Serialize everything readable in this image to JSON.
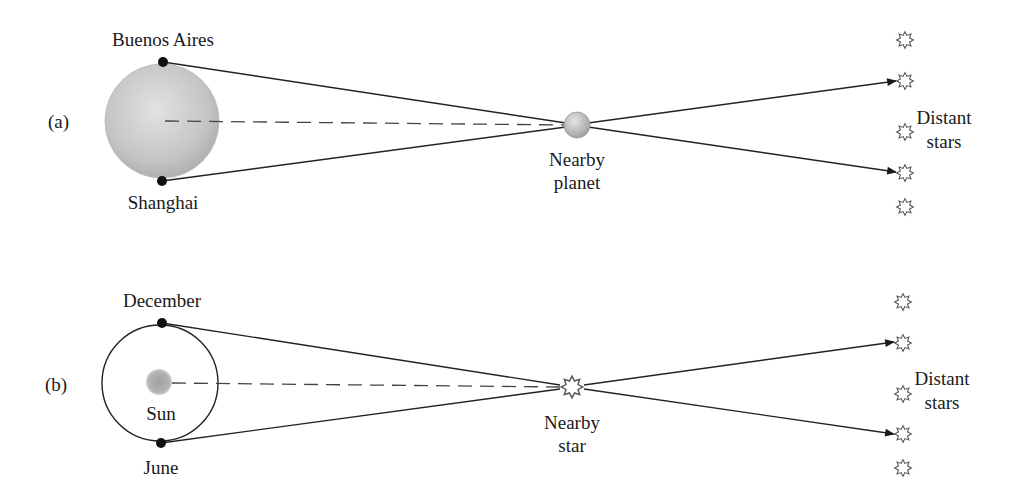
{
  "diagram": {
    "panel_a": {
      "tag": "(a)",
      "observer_top": "Buenos Aires",
      "observer_bottom": "Shanghai",
      "target_line1": "Nearby",
      "target_line2": "planet",
      "background_line1": "Distant",
      "background_line2": "stars"
    },
    "panel_b": {
      "tag": "(b)",
      "observer_top": "December",
      "observer_bottom": "June",
      "center_label": "Sun",
      "target_line1": "Nearby",
      "target_line2": "star",
      "background_line1": "Distant",
      "background_line2": "stars"
    },
    "colors": {
      "line": "#222222",
      "earth_fill": "#c8c8c8",
      "sun_fill": "#a8a8a8",
      "star_stroke": "#555555"
    }
  }
}
